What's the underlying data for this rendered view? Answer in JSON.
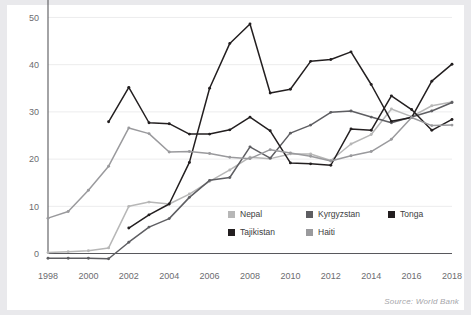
{
  "chart_data": {
    "type": "line",
    "title": "",
    "subtitle": "",
    "xlabel": "",
    "ylabel": "",
    "xlim": [
      1998,
      2018
    ],
    "ylim": [
      -2,
      52
    ],
    "yticks": [
      0,
      10,
      20,
      30,
      40,
      50
    ],
    "xticks": [
      1998,
      2000,
      2002,
      2004,
      2006,
      2008,
      2010,
      2012,
      2014,
      2016,
      2018
    ],
    "grid": true,
    "legend_position": "inside-lower-right",
    "source": "Source: World Bank",
    "x": [
      1998,
      1999,
      2000,
      2001,
      2002,
      2003,
      2004,
      2005,
      2006,
      2007,
      2008,
      2009,
      2010,
      2011,
      2012,
      2013,
      2014,
      2015,
      2016,
      2017,
      2018
    ],
    "series": [
      {
        "name": "Nepal",
        "color": "#b7b7b7",
        "values": [
          0.2,
          0.4,
          0.6,
          1.2,
          10.0,
          10.9,
          10.5,
          12.6,
          15.3,
          17.7,
          20.4,
          20.1,
          21.1,
          21.1,
          19.7,
          23.2,
          25.2,
          30.6,
          29.0,
          31.3,
          32.1
        ]
      },
      {
        "name": "Kyrgyzstan",
        "color": "#5e5e62",
        "values": [
          -1.0,
          -1.0,
          -1.0,
          -1.1,
          2.4,
          5.6,
          7.4,
          11.9,
          15.5,
          16.1,
          22.6,
          20.2,
          25.5,
          27.2,
          29.9,
          30.2,
          28.9,
          27.7,
          28.9,
          30.2,
          32.0
        ]
      },
      {
        "name": "Tonga",
        "color": "#231f20",
        "values": [
          null,
          null,
          null,
          27.9,
          35.2,
          27.7,
          27.5,
          25.3,
          25.3,
          26.2,
          28.9,
          26.0,
          19.2,
          19.0,
          18.7,
          26.4,
          26.1,
          33.4,
          30.5,
          26.1,
          28.4
        ]
      },
      {
        "name": "Tajikistan",
        "color": "#231f20",
        "values": [
          null,
          null,
          null,
          null,
          5.4,
          8.2,
          10.5,
          19.3,
          35.0,
          44.5,
          48.6,
          34.0,
          34.8,
          40.7,
          41.1,
          42.7,
          35.8,
          28.0,
          28.8,
          36.5,
          40.1
        ]
      },
      {
        "name": "Haiti",
        "color": "#9a9a9d",
        "values": [
          7.5,
          8.9,
          13.4,
          18.5,
          26.6,
          25.4,
          21.5,
          21.6,
          21.2,
          20.4,
          20.1,
          22.0,
          21.3,
          20.6,
          19.6,
          20.7,
          21.6,
          24.2,
          28.8,
          27.1,
          27.2
        ]
      }
    ]
  },
  "legend": {
    "items": [
      {
        "label": "Nepal",
        "color": "#b7b7b7"
      },
      {
        "label": "Kyrgyzstan",
        "color": "#5e5e62"
      },
      {
        "label": "Tonga",
        "color": "#231f20"
      },
      {
        "label": "Tajikistan",
        "color": "#231f20"
      },
      {
        "label": "Haiti",
        "color": "#9a9a9d"
      }
    ]
  },
  "footer": {
    "source_text": "Source: World Bank"
  },
  "colors": {
    "grid": "#ececed",
    "axis": "#58585c",
    "tick_text": "#6c6c70",
    "frame": "#e9e9ec",
    "source_text": "#a6a6aa"
  }
}
